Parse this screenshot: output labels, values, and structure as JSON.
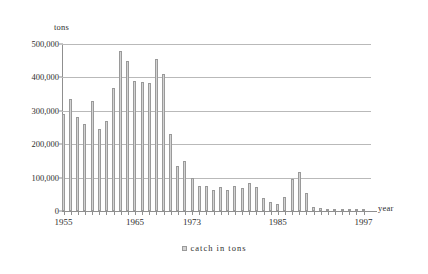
{
  "chart_data": {
    "type": "bar",
    "title": "",
    "xlabel": "year",
    "ylabel": "tons",
    "ylim": [
      0,
      500000
    ],
    "ytick_values": [
      0,
      100000,
      200000,
      300000,
      400000,
      500000
    ],
    "ytick_labels": [
      "0",
      "100,000",
      "200,000",
      "300,000",
      "400,000",
      "500,000"
    ],
    "xtick_labels": [
      "1955",
      "1965",
      "1973",
      "1985",
      "1997"
    ],
    "xtick_values": [
      1955,
      1965,
      1973,
      1985,
      1997
    ],
    "grid": true,
    "legend": [
      {
        "label": "catch  in  tons",
        "color": "#d3d3d3"
      }
    ],
    "legend_position": "bottom-center",
    "series": [
      {
        "name": "catch in tons",
        "color": "#d3d3d3",
        "edge_color": "#9a9a9a"
      }
    ],
    "categories": [
      1955,
      1956,
      1957,
      1958,
      1959,
      1960,
      1961,
      1962,
      1963,
      1964,
      1965,
      1966,
      1967,
      1968,
      1969,
      1970,
      1971,
      1972,
      1973,
      1974,
      1975,
      1976,
      1977,
      1978,
      1979,
      1980,
      1981,
      1982,
      1983,
      1984,
      1985,
      1986,
      1987,
      1988,
      1989,
      1990,
      1991,
      1992,
      1993,
      1994,
      1995,
      1996,
      1997
    ],
    "values": [
      290000,
      335000,
      280000,
      260000,
      330000,
      245000,
      270000,
      368000,
      480000,
      450000,
      388000,
      385000,
      382000,
      455000,
      410000,
      232000,
      135000,
      150000,
      100000,
      75000,
      75000,
      62000,
      72000,
      62000,
      75000,
      70000,
      85000,
      72000,
      40000,
      28000,
      22000,
      42000,
      95000,
      118000,
      55000,
      12000,
      10000,
      7000,
      5000,
      4000,
      3000,
      2500,
      2000
    ]
  }
}
